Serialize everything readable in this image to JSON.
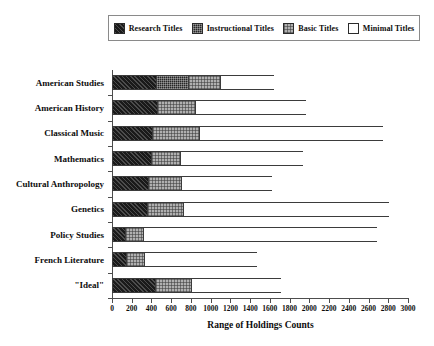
{
  "chart_data": {
    "type": "bar",
    "orientation": "horizontal",
    "stacked": true,
    "title": "",
    "xlabel": "Range of Holdings Counts",
    "ylabel": "",
    "xlim": [
      0,
      3000
    ],
    "xticks": [
      0,
      200,
      400,
      600,
      800,
      1000,
      1200,
      1400,
      1600,
      1800,
      2000,
      2200,
      2400,
      2600,
      2800,
      3000
    ],
    "grid": false,
    "legend_position": "top",
    "categories": [
      "American Studies",
      "American History",
      "Classical Music",
      "Mathematics",
      "Cultural Anthropology",
      "Genetics",
      "Policy Studies",
      "French Literature",
      "\"Ideal\""
    ],
    "series": [
      {
        "name": "Research Titles",
        "color": "#1a1a1a",
        "values": [
          450,
          460,
          405,
          400,
          360,
          355,
          130,
          140,
          435
        ]
      },
      {
        "name": "Instructional Titles",
        "color": "#262626",
        "values": [
          320,
          0,
          0,
          0,
          0,
          0,
          0,
          0,
          0
        ]
      },
      {
        "name": "Basic Titles",
        "color": "#b0b0b0",
        "values": [
          320,
          385,
          475,
          290,
          340,
          360,
          185,
          185,
          370
        ]
      },
      {
        "name": "Minimal Titles",
        "color": "#ffffff",
        "values": [
          550,
          1120,
          1865,
          1245,
          920,
          2090,
          2370,
          1145,
          905
        ]
      }
    ],
    "totals": [
      1640,
      1965,
      2745,
      1935,
      1620,
      2805,
      2685,
      1470,
      1710
    ]
  },
  "legend": {
    "items": [
      {
        "label": "Research Titles",
        "swatch": "research"
      },
      {
        "label": "Instructional Titles",
        "swatch": "instructional"
      },
      {
        "label": "Basic Titles",
        "swatch": "basic"
      },
      {
        "label": "Minimal Titles",
        "swatch": "minimal"
      }
    ]
  }
}
